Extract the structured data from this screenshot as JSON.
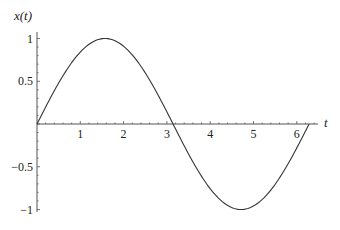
{
  "chart_data": {
    "type": "line",
    "title": "",
    "xlabel": "t",
    "ylabel": "x(t)",
    "xlim": [
      0,
      6.283
    ],
    "ylim": [
      -1,
      1
    ],
    "grid": false,
    "legend": null,
    "x_ticks": [
      1,
      2,
      3,
      4,
      5,
      6
    ],
    "x_tick_labels": [
      "1",
      "2",
      "3",
      "4",
      "5",
      "6"
    ],
    "y_ticks": [
      1,
      0.5,
      -0.5,
      -1
    ],
    "y_tick_labels": [
      "1",
      "0.5",
      "−0.5",
      "−1"
    ],
    "series": [
      {
        "name": "x(t) = sin(t)",
        "function": "sin(t)",
        "x": [
          0,
          0.5,
          1,
          1.5708,
          2,
          2.5,
          3,
          3.1416,
          3.5,
          4,
          4.7124,
          5,
          5.5,
          6,
          6.2832
        ],
        "y": [
          0,
          0.479,
          0.841,
          1,
          0.909,
          0.598,
          0.141,
          0,
          -0.351,
          -0.757,
          -1,
          -0.959,
          -0.706,
          -0.279,
          0
        ],
        "color": "#333333"
      }
    ]
  }
}
